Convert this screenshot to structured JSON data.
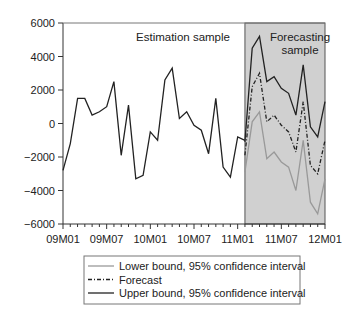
{
  "chart_data": {
    "type": "line",
    "title": "",
    "xlabel": "",
    "ylabel": "",
    "ylim": [
      -6000,
      6000
    ],
    "yticks": [
      6000,
      4000,
      2000,
      0,
      -2000,
      -4000,
      -6000
    ],
    "ytick_labels": [
      "6000",
      "4000",
      "2000",
      "0",
      "−2000",
      "−4000",
      "−6000"
    ],
    "xtick_labels": [
      "09M01",
      "09M07",
      "10M01",
      "10M07",
      "11M01",
      "11M07",
      "12M01"
    ],
    "xtick_months": [
      0,
      6,
      12,
      18,
      24,
      30,
      36
    ],
    "grid": false,
    "annotations": {
      "estimation": "Estimation sample",
      "forecasting_line1": "Forecasting",
      "forecasting_line2": "sample"
    },
    "forecast_region_start_month": 25,
    "forecast_region_end_month": 36,
    "forecast_region_color": "#d0d0d0",
    "actual": {
      "start_month": 0,
      "values": [
        -2800,
        -1200,
        1500,
        1500,
        500,
        700,
        1000,
        2500,
        -1900,
        1100,
        -3300,
        -3100,
        -500,
        -1000,
        2600,
        3300,
        300,
        700,
        -100,
        -400,
        -1800,
        1500,
        -2600,
        -3200,
        -800,
        -1000
      ]
    },
    "series": [
      {
        "name": "Lower bound, 95% confidence interval",
        "color": "#999999",
        "style": "solid",
        "start_month": 25,
        "values": [
          -2900,
          100,
          700,
          -2100,
          -1700,
          -2300,
          -2600,
          -4000,
          -1000,
          -4700,
          -5400,
          -3300
        ]
      },
      {
        "name": "Forecast",
        "color": "#222222",
        "style": "dashdot",
        "start_month": 25,
        "values": [
          -1900,
          2200,
          3000,
          100,
          500,
          -100,
          -500,
          -1700,
          1300,
          -2500,
          -3000,
          -1000
        ]
      },
      {
        "name": "Upper bound, 95% confidence interval",
        "color": "#222222",
        "style": "solid",
        "start_month": 25,
        "values": [
          -1100,
          4500,
          5200,
          2500,
          2800,
          2100,
          1800,
          500,
          3500,
          -200,
          -800,
          1300
        ]
      }
    ],
    "legend_position": "bottom"
  }
}
